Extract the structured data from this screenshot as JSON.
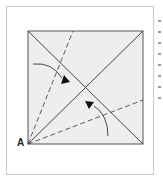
{
  "diagram": {
    "type": "origami-fold-instruction",
    "point_label": "A",
    "square": {
      "x": 28,
      "y": 31,
      "size": 115,
      "fill": "#eeeeee",
      "stroke": "#555555"
    },
    "lines": {
      "diagonals": "solid",
      "fold_guides": "dashed"
    },
    "arrows": [
      {
        "name": "fold-arrow-upper",
        "direction": "down-right"
      },
      {
        "name": "fold-arrow-lower",
        "direction": "up-left"
      }
    ]
  }
}
